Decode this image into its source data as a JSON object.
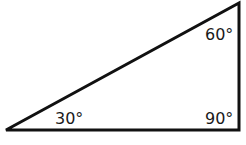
{
  "diagram": {
    "type": "right-triangle",
    "vertices": {
      "bottom_left": [
        6,
        130
      ],
      "bottom_right": [
        239,
        130
      ],
      "top_right": [
        239,
        3
      ]
    },
    "stroke_color": "#111111",
    "angles": [
      {
        "vertex": "bottom_left",
        "label": "30°"
      },
      {
        "vertex": "top_right",
        "label": "60°"
      },
      {
        "vertex": "bottom_right",
        "label": "90°"
      }
    ]
  }
}
